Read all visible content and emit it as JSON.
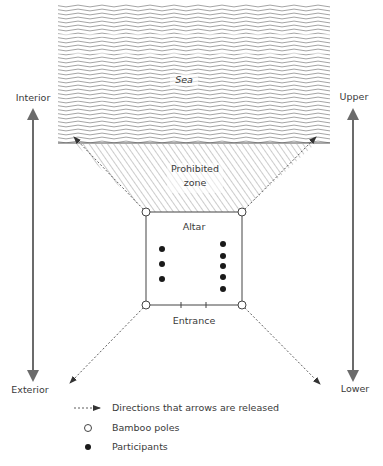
{
  "diagram": {
    "regions": {
      "sea": {
        "label": "Sea"
      },
      "prohibited_zone": {
        "label_line1": "Prohibited",
        "label_line2": "zone"
      },
      "altar": {
        "label": "Altar"
      },
      "entrance": {
        "label": "Entrance"
      }
    },
    "axes": {
      "left": {
        "top": "Interior",
        "bottom": "Exterior"
      },
      "right": {
        "top": "Upper",
        "bottom": "Lower"
      }
    },
    "participants": {
      "left_column_count": 3,
      "right_column_count": 5
    },
    "legend": [
      {
        "icon": "dashed-arrow-icon",
        "label": "Directions that arrows are released"
      },
      {
        "icon": "open-circle-icon",
        "label": "Bamboo poles"
      },
      {
        "icon": "filled-circle-icon",
        "label": "Participants"
      }
    ],
    "colors": {
      "wave_line": "#9a9a9a",
      "hatch_line": "#9a9a9a",
      "axis_arrow": "#6b6b6b",
      "text": "#3a3a3a",
      "dot": "#1a1a1a"
    }
  }
}
